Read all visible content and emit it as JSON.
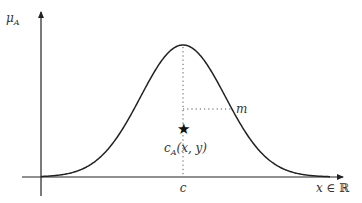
{
  "figure": {
    "y_axis_label": "μ",
    "y_axis_label_sub": "A",
    "x_axis_label_var": "x",
    "x_axis_label_rest": " ∈ ℝ",
    "center_label": "c",
    "width_label": "m",
    "point_label_main": "c",
    "point_label_sub": "A",
    "point_label_args": "(x, y)",
    "point_marker": "★"
  },
  "colors": {
    "curve": "#222222",
    "axes": "#222222",
    "dotted": "#555555",
    "text": "#333333"
  },
  "geometry": {
    "origin_x": 41,
    "baseline_y": 177,
    "center_x": 183,
    "peak_y": 45,
    "sigma_px": 42.5,
    "width_y": 109,
    "width_x_end": 232,
    "star_y": 129
  }
}
